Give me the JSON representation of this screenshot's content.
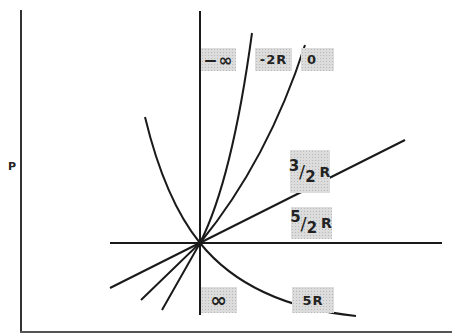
{
  "diagram": {
    "y_axis_label": "P",
    "colors": {
      "line": "#1a1a1a",
      "label_bg": "#dcdcdc"
    },
    "origin": [
      200,
      243
    ],
    "labels": {
      "neg_inf": "−∞",
      "neg_2r": "-2R",
      "zero": "0",
      "three_halves_r": {
        "num": "3",
        "den": "2",
        "r": "R"
      },
      "five_halves_r": {
        "num": "5",
        "den": "2",
        "r": "R"
      },
      "inf": "∞",
      "five_r": "5R"
    },
    "curves": [
      {
        "name": "−∞",
        "shape": "vertical line"
      },
      {
        "name": "-2R",
        "shape": "steep curve"
      },
      {
        "name": "0",
        "shape": "curve"
      },
      {
        "name": "3/2R",
        "shape": "straight line"
      },
      {
        "name": "5/2R",
        "shape": "horizontal line"
      },
      {
        "name": "5R",
        "shape": "decreasing curve"
      },
      {
        "name": "∞",
        "shape": "vertical line"
      }
    ]
  }
}
